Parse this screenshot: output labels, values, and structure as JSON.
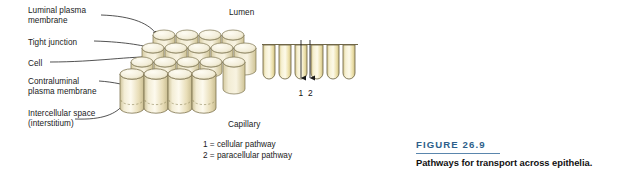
{
  "figure": {
    "number_label": "FIGURE 26.9",
    "caption": "Pathways for transport across epithelia.",
    "accent_color": "#2e5f8a",
    "rule_color": "#5a86ad"
  },
  "labels": {
    "luminal_plasma_membrane": "Luminal plasma\nmembrane",
    "tight_junction": "Tight junction",
    "cell": "Cell",
    "contraluminal_plasma_membrane": "Contraluminal\nplasma membrane",
    "intercellular_space": "Intercellular space\n(interstitium)",
    "lumen": "Lumen",
    "capillary": "Capillary"
  },
  "legend": {
    "text": "1 = cellular pathway\n2 = paracellular pathway",
    "items": [
      {
        "number": "1",
        "name": "cellular pathway"
      },
      {
        "number": "2",
        "name": "paracellular pathway"
      }
    ]
  },
  "cross_section": {
    "cell_count": 6,
    "arrow_numbers": [
      "1",
      "2"
    ],
    "arrow_1_label": "1",
    "arrow_2_label": "2"
  },
  "diagram_colors": {
    "cell_fill_light": "#fbf7e4",
    "cell_fill_mid": "#ece2bb",
    "cell_fill_deep": "#dacf9d",
    "cell_outline": "#7d7450",
    "cap_fill": "#f3eeda",
    "leader_line": "#1a1a1a"
  },
  "cluster": {
    "description": "three-dimensional array of columnar epithelial cells",
    "rows": 4,
    "front_row_cells": 4
  }
}
